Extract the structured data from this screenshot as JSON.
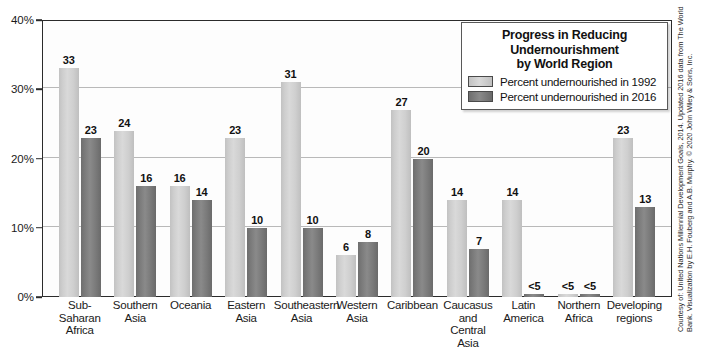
{
  "chart_data": {
    "type": "bar",
    "xlabel": "",
    "ylabel": "",
    "ylim": [
      0,
      40
    ],
    "y_unit": "%",
    "grid": true,
    "legend_position": "top-right",
    "y_ticks": [
      "0%",
      "10%",
      "20%",
      "30%",
      "40%"
    ],
    "y_tick_values": [
      0,
      10,
      20,
      30,
      40
    ],
    "categories": [
      "Sub-Saharan Africa",
      "Southern Asia",
      "Oceania",
      "Eastern Asia",
      "Southeastern Asia",
      "Western Asia",
      "Caribbean",
      "Caucasus and Central Asia",
      "Latin America",
      "Northern Africa",
      "Developing regions"
    ],
    "category_lines": [
      [
        "Sub-Saharan",
        "Africa"
      ],
      [
        "Southern",
        "Asia"
      ],
      [
        "Oceania"
      ],
      [
        "Eastern",
        "Asia"
      ],
      [
        "Southeastern",
        "Asia"
      ],
      [
        "Western",
        "Asia"
      ],
      [
        "Caribbean"
      ],
      [
        "Caucasus",
        "and",
        "Central Asia"
      ],
      [
        "Latin",
        "America"
      ],
      [
        "Northern",
        "Africa"
      ],
      [
        "Developing",
        "regions"
      ]
    ],
    "series": [
      {
        "name": "Percent undernourished in 1992",
        "color": "#d0d0d0",
        "values": [
          33,
          24,
          16,
          23,
          31,
          6,
          27,
          14,
          14,
          4,
          23
        ],
        "labels": [
          "33",
          "24",
          "16",
          "23",
          "31",
          "6",
          "27",
          "14",
          "14",
          "<5",
          "23"
        ]
      },
      {
        "name": "Percent undernourished in 2016",
        "color": "#7d7d7d",
        "values": [
          23,
          16,
          14,
          10,
          10,
          8,
          20,
          7,
          4,
          4,
          13
        ],
        "labels": [
          "23",
          "16",
          "14",
          "10",
          "10",
          "8",
          "20",
          "7",
          "<5",
          "<5",
          "13"
        ]
      }
    ]
  },
  "legend": {
    "title_lines": [
      "Progress in Reducing",
      "Undernourishment",
      "by World Region"
    ],
    "entries": [
      {
        "label": "Percent undernourished in 1992",
        "swatch": "light"
      },
      {
        "label": "Percent undernourished in 2016",
        "swatch": "dark"
      }
    ]
  },
  "credit": {
    "text": "Courtesy of: United Nations Millennial Development Goals, 2014. Updated 2016 data from The World Bank. Visualization by E.H. Fouberg and A.B. Murphy. © 2020 John Wiley & Sons, Inc."
  },
  "colors": {
    "series_1992": "#d0d0d0",
    "series_2016": "#7d7d7d",
    "frame": "#2b2b2b",
    "gridline": "#b9b9b9",
    "background": "#ffffff"
  }
}
